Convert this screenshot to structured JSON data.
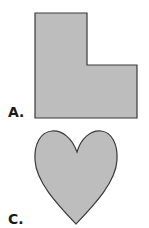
{
  "figures": [
    {
      "id": "A",
      "label": "A.",
      "shape": "L-shape",
      "fill": "#bdbdbd",
      "stroke": "#3a3a3a"
    },
    {
      "id": "C",
      "label": "C.",
      "shape": "heart",
      "fill": "#bdbdbd",
      "stroke": "#3a3a3a"
    }
  ]
}
